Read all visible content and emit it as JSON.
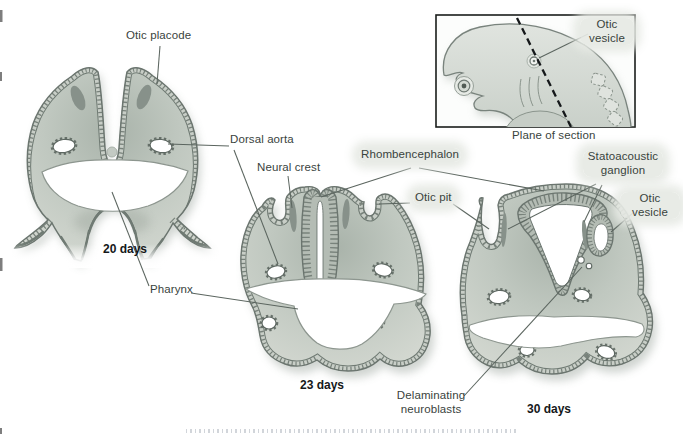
{
  "figure": {
    "type": "embryology-otic-development-diagram",
    "inset": {
      "otic_vesicle": {
        "line1": "Otic",
        "line2": "vesicle"
      },
      "plane_of_section": "Plane of section"
    },
    "labels": {
      "otic_placode": "Otic placode",
      "dorsal_aorta": "Dorsal aorta",
      "neural_crest": "Neural crest",
      "rhombencephalon": "Rhombencephalon",
      "otic_pit": "Otic pit",
      "statoacoustic_ganglion": {
        "line1": "Statoacoustic",
        "line2": "ganglion"
      },
      "otic_vesicle": {
        "line1": "Otic",
        "line2": "vesicle"
      },
      "pharynx": "Pharynx",
      "delaminating_neuroblasts": {
        "line1": "Delaminating",
        "line2": "neuroblasts"
      }
    },
    "stage_labels": {
      "day20": "20 days",
      "day23": "23 days",
      "day30": "30 days"
    },
    "palette": {
      "body_fill": "#ccd2cb",
      "body_shade": "#a9b3aa",
      "outline": "#6b756f",
      "hatch_tick": "#78827b",
      "hatch_base": "#c8cec7",
      "neural_crest": "#87918a",
      "cavity": "#ffffff",
      "leader_line": "#5b655f",
      "label_text": "#39433d",
      "stage_text": "#15181a",
      "label_highlight": "#e6e9e4",
      "inset_border": "#1a1d1b"
    }
  }
}
